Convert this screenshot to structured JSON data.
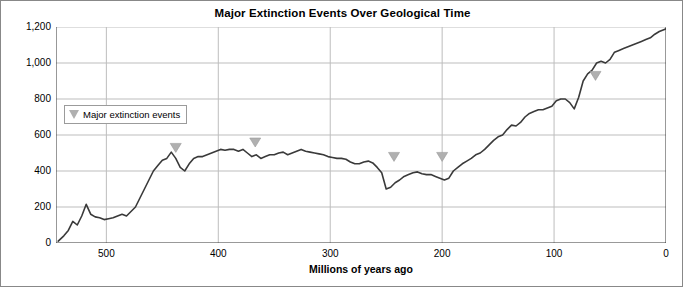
{
  "chart_data": {
    "type": "line",
    "title": "Major Extinction Events Over Geological Time",
    "xlabel": "Millions of years ago",
    "ylabel": "Number of marine families",
    "xlim": [
      545,
      0
    ],
    "ylim": [
      0,
      1200
    ],
    "x_reversed": true,
    "grid": true,
    "gridlines": "vertical at 500, 400, 300, 200, 100, 0 and horizontal at 200..1200",
    "xticks": [
      500,
      400,
      300,
      200,
      100,
      0
    ],
    "xtick_labels": [
      "500",
      "400",
      "300",
      "200",
      "100",
      "0"
    ],
    "yticks": [
      0,
      200,
      400,
      600,
      800,
      1000,
      1200
    ],
    "ytick_labels": [
      "0",
      "200",
      "400",
      "600",
      "800",
      "1,000",
      "1,200"
    ],
    "legend": {
      "position": "upper-left-inside",
      "entries": [
        {
          "label": "Major extinction events",
          "marker": "down-triangle",
          "color": "#b0b0b0"
        }
      ]
    },
    "series": [
      {
        "name": "Number of marine families",
        "color": "#3a3a3a",
        "x": [
          543,
          538,
          534,
          530,
          526,
          522,
          518,
          514,
          510,
          506,
          502,
          498,
          494,
          490,
          486,
          482,
          478,
          474,
          470,
          466,
          462,
          458,
          454,
          450,
          446,
          442,
          438,
          434,
          430,
          426,
          422,
          418,
          414,
          410,
          406,
          402,
          398,
          394,
          390,
          386,
          382,
          378,
          374,
          370,
          366,
          362,
          358,
          354,
          350,
          346,
          342,
          338,
          334,
          330,
          326,
          322,
          318,
          314,
          310,
          306,
          302,
          298,
          294,
          290,
          286,
          282,
          278,
          274,
          270,
          266,
          262,
          258,
          254,
          250,
          246,
          242,
          238,
          234,
          230,
          226,
          222,
          218,
          214,
          210,
          206,
          202,
          198,
          194,
          190,
          186,
          182,
          178,
          174,
          170,
          166,
          162,
          158,
          154,
          150,
          146,
          142,
          138,
          134,
          130,
          126,
          122,
          118,
          114,
          110,
          106,
          102,
          98,
          94,
          90,
          86,
          82,
          78,
          74,
          70,
          66,
          62,
          58,
          54,
          50,
          46,
          42,
          38,
          34,
          30,
          26,
          22,
          18,
          14,
          10,
          6,
          2,
          0
        ],
        "y": [
          10,
          40,
          70,
          120,
          100,
          150,
          215,
          160,
          145,
          140,
          130,
          135,
          140,
          150,
          160,
          150,
          175,
          200,
          250,
          300,
          350,
          400,
          430,
          460,
          470,
          505,
          470,
          420,
          400,
          440,
          470,
          480,
          480,
          490,
          500,
          510,
          520,
          515,
          520,
          520,
          510,
          520,
          500,
          480,
          490,
          470,
          480,
          490,
          490,
          500,
          505,
          490,
          500,
          510,
          520,
          510,
          505,
          500,
          495,
          490,
          480,
          475,
          470,
          470,
          465,
          450,
          440,
          440,
          450,
          455,
          445,
          420,
          390,
          300,
          310,
          335,
          350,
          370,
          380,
          390,
          395,
          385,
          380,
          380,
          370,
          360,
          350,
          360,
          400,
          420,
          440,
          455,
          470,
          490,
          500,
          520,
          545,
          570,
          590,
          600,
          630,
          655,
          650,
          670,
          700,
          720,
          730,
          740,
          740,
          750,
          760,
          790,
          800,
          800,
          780,
          745,
          810,
          900,
          940,
          960,
          1000,
          1010,
          1000,
          1020,
          1060,
          1070,
          1080,
          1090,
          1100,
          1110,
          1120,
          1130,
          1140,
          1160,
          1175,
          1185,
          1190
        ]
      }
    ],
    "annotations": [
      {
        "type": "down-triangle",
        "x": 438,
        "y": 470,
        "label": ""
      },
      {
        "type": "down-triangle",
        "x": 367,
        "y": 500,
        "label": ""
      },
      {
        "type": "down-triangle",
        "x": 243,
        "y": 420,
        "label": ""
      },
      {
        "type": "down-triangle",
        "x": 200,
        "y": 420,
        "label": ""
      },
      {
        "type": "down-triangle",
        "x": 63,
        "y": 870,
        "label": ""
      }
    ]
  }
}
